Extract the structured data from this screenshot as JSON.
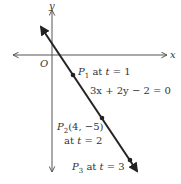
{
  "axes": {
    "x_label": "x",
    "y_label": "y",
    "origin_label": "O"
  },
  "line": {
    "equation": "3x + 2y − 2 = 0"
  },
  "points": [
    {
      "name": "P",
      "sub": "1",
      "coords": "",
      "label_rest": " at ",
      "t_var": "t",
      "t_value": " = 1"
    },
    {
      "name": "P",
      "sub": "2",
      "coords": "(4, −5)",
      "label_rest": "at ",
      "t_var": "t",
      "t_value": " = 2"
    },
    {
      "name": "P",
      "sub": "3",
      "coords": "",
      "label_rest": " at ",
      "t_var": "t",
      "t_value": " = 3"
    }
  ],
  "colors": {
    "axis": "#555555",
    "line": "#222222",
    "text": "#333333"
  }
}
